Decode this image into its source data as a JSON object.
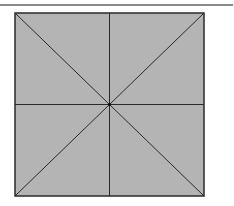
{
  "diagram": {
    "type": "square-with-bisectors",
    "colors": {
      "fill": "#b4b4b4",
      "stroke": "#2a2a2a",
      "rule": "#8a8a8a",
      "background": "#ffffff"
    },
    "square": {
      "x": 15,
      "y": 13,
      "width": 189,
      "height": 183
    },
    "center": {
      "x": 109.5,
      "y": 104.5
    },
    "lines": [
      "vertical-midline",
      "horizontal-midline",
      "diagonal-main",
      "diagonal-anti"
    ]
  }
}
